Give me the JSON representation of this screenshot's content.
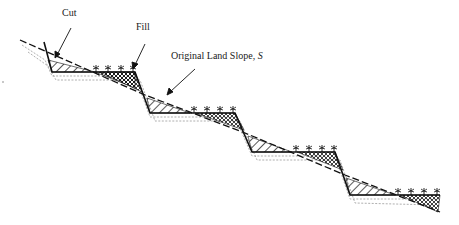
{
  "diagram": {
    "type": "terrace-cross-section",
    "labels": {
      "cut": "Cut",
      "fill": "Fill",
      "slope_prefix": "Original Land Slope, ",
      "slope_symbol": "S"
    },
    "colors": {
      "line": "#111111",
      "soil": "#9a9a9a",
      "text": "#222222"
    },
    "terraces": 4,
    "plants_per_bench": 4
  }
}
